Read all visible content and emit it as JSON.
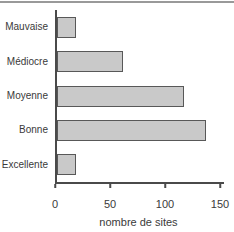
{
  "chart_data": {
    "type": "bar",
    "orientation": "horizontal",
    "title": "",
    "xlabel": "nombre de sites",
    "ylabel": "",
    "categories": [
      "Mauvaise",
      "Médiocre",
      "Moyenne",
      "Bonne",
      "Excellente"
    ],
    "values": [
      17,
      60,
      115,
      135,
      17
    ],
    "xlim": [
      0,
      150
    ],
    "xticks": [
      0,
      50,
      100,
      150
    ],
    "grid": false,
    "legend": "none",
    "colors": {
      "bar_fill": "#c9c9c9",
      "bar_border": "#585858",
      "axis": "#4a4a4a",
      "text": "#3a3a3a",
      "top_rule": "#999999",
      "background": "#ffffff"
    }
  }
}
